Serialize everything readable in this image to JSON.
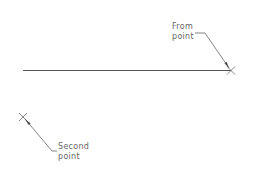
{
  "diagram": {
    "type": "cad-line-construction",
    "colors": {
      "background": "#ffffff",
      "line": "#555555",
      "leader": "#666666",
      "text": "#666666"
    },
    "line": {
      "x1": 23,
      "y1": 70.5,
      "x2": 231,
      "y2": 70.5
    },
    "points": [
      {
        "id": "from",
        "x": 231,
        "y": 70.5,
        "label_line1": "From",
        "label_line2": "point",
        "label_x": 172,
        "label_y": 22,
        "leader": [
          [
            195,
            33
          ],
          [
            205,
            33
          ],
          [
            228,
            67
          ]
        ]
      },
      {
        "id": "second",
        "x": 23,
        "y": 117,
        "label_line1": "Second",
        "label_line2": "point",
        "label_x": 58,
        "label_y": 142,
        "leader": [
          [
            26,
            120
          ],
          [
            52,
            151
          ],
          [
            57,
            151
          ]
        ]
      }
    ]
  }
}
